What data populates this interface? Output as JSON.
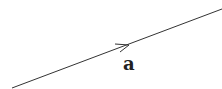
{
  "diagram": {
    "type": "vector",
    "vector_label": "a",
    "stroke_color": "#333333",
    "label_color": "#222222",
    "arrow_direction": "up-right"
  }
}
